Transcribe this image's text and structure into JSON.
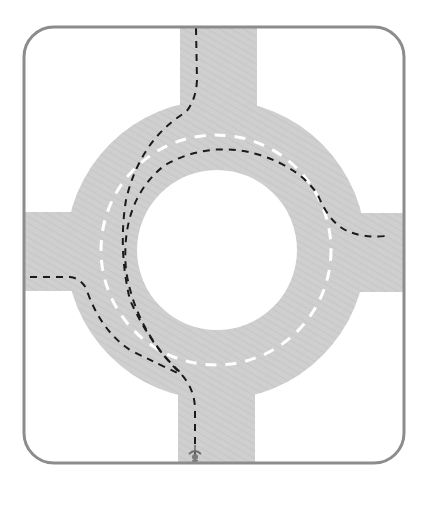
{
  "diagram": {
    "colors": {
      "background": "#ffffff",
      "frame": "#8c8c8c",
      "road": "#cfcfcf",
      "road_hatch": "#c4c4c4",
      "lane_marking": "#ffffff",
      "route_line": "#1a1a1a",
      "cyclist": "#7a7a7a"
    },
    "roads": [
      "north-arm",
      "east-arm",
      "south-arm",
      "west-arm",
      "ring"
    ],
    "icons": {
      "cyclist": "bicycle-rider-icon"
    }
  }
}
